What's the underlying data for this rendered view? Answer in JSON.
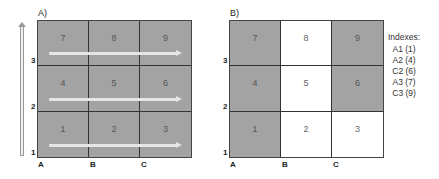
{
  "panel_a": {
    "label": "A)",
    "cells": [
      "7",
      "8",
      "9",
      "4",
      "5",
      "6",
      "1",
      "2",
      "3"
    ],
    "shading": [
      "shaded",
      "shaded",
      "shaded",
      "shaded",
      "shaded",
      "shaded",
      "shaded",
      "shaded",
      "shaded"
    ],
    "row_labels": [
      "3",
      "2",
      "1"
    ],
    "col_labels": [
      "A",
      "B",
      "C"
    ]
  },
  "panel_b": {
    "label": "B)",
    "cells": [
      "7",
      "8",
      "9",
      "4",
      "5",
      "6",
      "1",
      "2",
      "3"
    ],
    "shading": [
      "shaded",
      "white",
      "shaded",
      "shaded",
      "white",
      "shaded",
      "shaded",
      "white",
      "white"
    ],
    "row_labels": [
      "3",
      "2",
      "1"
    ],
    "col_labels": [
      "A",
      "B",
      "C"
    ]
  },
  "indexes": {
    "title": "Indexes:",
    "items": [
      "A1 (1)",
      "A2 (4)",
      "C2 (6)",
      "A3 (7)",
      "C3 (9)"
    ]
  },
  "colors": {
    "shaded": "#a3a3a3",
    "white": "#ffffff",
    "grid_line": "#333333",
    "arrow": "#e6e6e6"
  }
}
